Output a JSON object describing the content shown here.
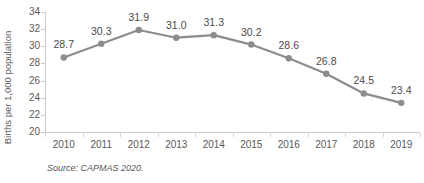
{
  "chart_data": {
    "type": "line",
    "title": "",
    "subtitle": "",
    "xlabel": "",
    "ylabel": "Births per 1,000 population",
    "categories": [
      "2010",
      "2011",
      "2012",
      "2013",
      "2014",
      "2015",
      "2016",
      "2017",
      "2018",
      "2019"
    ],
    "values": [
      28.7,
      30.3,
      31.9,
      31.0,
      31.3,
      30.2,
      28.6,
      26.8,
      24.5,
      23.4
    ],
    "point_labels": [
      "28.7",
      "30.3",
      "31.9",
      "31.0",
      "31.3",
      "30.2",
      "28.6",
      "26.8",
      "24.5",
      "23.4"
    ],
    "ylim": [
      20,
      34
    ],
    "yticks": [
      20,
      22,
      24,
      26,
      28,
      30,
      32,
      34
    ],
    "ytick_labels": [
      "20",
      "22",
      "24",
      "26",
      "28",
      "30",
      "32",
      "34"
    ],
    "grid": false,
    "legend": "none",
    "series_color": "#8c8c8c",
    "marker": "circle",
    "marker_color": "#8c8c8c",
    "axis_color": "#c9cacc",
    "text_color": "#58595b"
  },
  "source_note": "Source: CAPMAS 2020."
}
